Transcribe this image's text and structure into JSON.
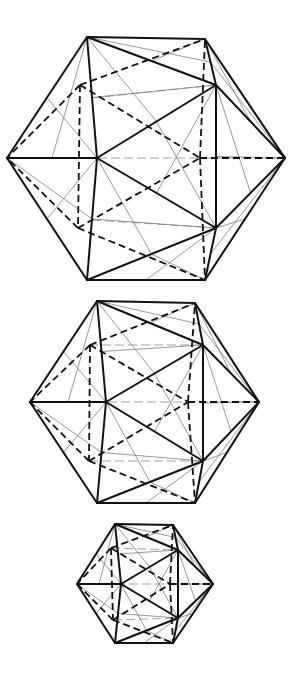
{
  "diagram": {
    "type": "icosahedron-wireframes",
    "count": 3,
    "colors": {
      "line": "#111111",
      "construction": "#6a6a6a",
      "background": "#ffffff"
    },
    "figures": [
      {
        "name": "icosahedron-large",
        "vertices": {
          "T1": [
            87,
            37
          ],
          "T2": [
            205,
            39
          ],
          "L": [
            7,
            158
          ],
          "R": [
            285,
            158
          ],
          "B1": [
            87,
            280
          ],
          "B2": [
            205,
            280
          ],
          "C": [
            97,
            158
          ],
          "RU": [
            216,
            85
          ],
          "RD": [
            216,
            228
          ],
          "LU": [
            92,
            98
          ],
          "LD": [
            92,
            220
          ],
          "HU": [
            80,
            85
          ],
          "HD": [
            78,
            228
          ],
          "HR": [
            200,
            158
          ],
          "HT": [
            148,
            58
          ],
          "HB": [
            148,
            255
          ]
        }
      },
      {
        "name": "icosahedron-medium",
        "vertices": {
          "T1": [
            97,
            301
          ],
          "T2": [
            195,
            303
          ],
          "L": [
            30,
            402
          ],
          "R": [
            259,
            402
          ],
          "B1": [
            97,
            503
          ],
          "B2": [
            195,
            503
          ],
          "C": [
            106,
            402
          ],
          "RU": [
            203,
            345
          ],
          "RD": [
            203,
            461
          ],
          "LU": [
            89,
            345
          ],
          "LD": [
            89,
            461
          ],
          "HU": [
            90,
            345
          ],
          "HD": [
            89,
            461
          ],
          "HR": [
            188,
            402
          ],
          "HT": [
            150,
            320
          ],
          "HB": [
            150,
            485
          ]
        }
      },
      {
        "name": "icosahedron-small",
        "vertices": {
          "T1": [
            115,
            524
          ],
          "T2": [
            173,
            525
          ],
          "L": [
            77,
            584
          ],
          "R": [
            213,
            584
          ],
          "B1": [
            115,
            643
          ],
          "B2": [
            173,
            643
          ],
          "C": [
            121,
            584
          ],
          "RU": [
            178,
            550
          ],
          "RD": [
            178,
            618
          ],
          "LU": [
            111,
            548
          ],
          "LD": [
            113,
            620
          ],
          "HU": [
            111,
            548
          ],
          "HD": [
            113,
            620
          ],
          "HR": [
            170,
            584
          ],
          "HT": [
            145,
            535
          ],
          "HB": [
            145,
            632
          ]
        }
      }
    ],
    "visible_edges": [
      [
        "T1",
        "T2"
      ],
      [
        "T2",
        "R"
      ],
      [
        "R",
        "B2"
      ],
      [
        "B2",
        "B1"
      ],
      [
        "B1",
        "L"
      ],
      [
        "L",
        "T1"
      ],
      [
        "T1",
        "C"
      ],
      [
        "C",
        "B1"
      ],
      [
        "L",
        "C"
      ],
      [
        "T1",
        "RU"
      ],
      [
        "T2",
        "RU"
      ],
      [
        "RU",
        "R"
      ],
      [
        "RU",
        "C"
      ],
      [
        "RU",
        "RD"
      ],
      [
        "C",
        "RD"
      ],
      [
        "RD",
        "R"
      ],
      [
        "RD",
        "B2"
      ],
      [
        "RD",
        "B1"
      ]
    ],
    "hidden_edges": [
      [
        "HU",
        "T2"
      ],
      [
        "HU",
        "L"
      ],
      [
        "HU",
        "HR"
      ],
      [
        "HU",
        "HD"
      ],
      [
        "HD",
        "L"
      ],
      [
        "HD",
        "B2"
      ],
      [
        "HD",
        "HR"
      ],
      [
        "HR",
        "T2"
      ],
      [
        "HR",
        "B2"
      ],
      [
        "HR",
        "R"
      ]
    ]
  }
}
